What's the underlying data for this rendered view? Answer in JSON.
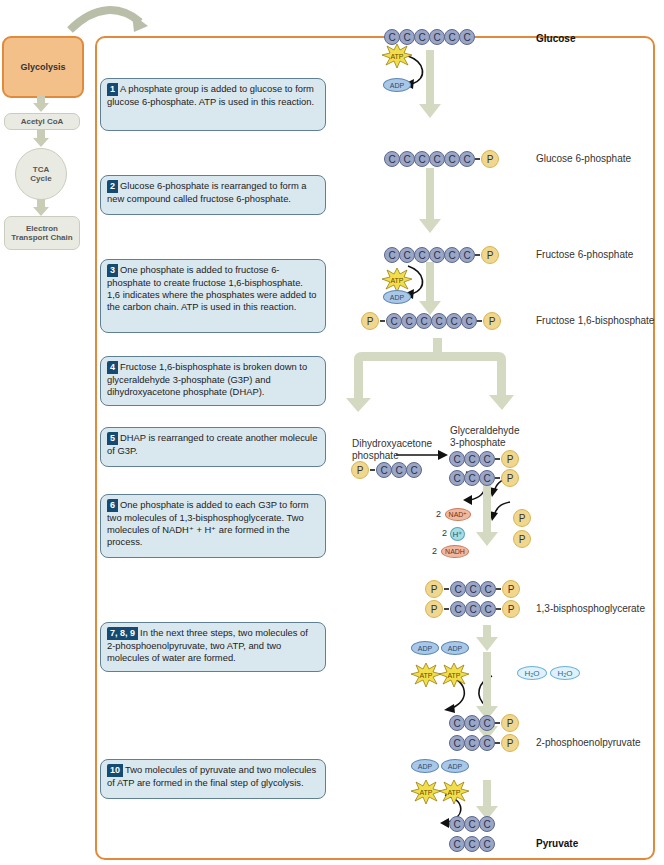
{
  "sidebar": {
    "items": [
      {
        "label": "Glycolysis",
        "active": true
      },
      {
        "label": "Acetyl CoA"
      },
      {
        "label": "TCA Cycle"
      },
      {
        "label": "Electron Transport Chain"
      }
    ]
  },
  "steps": [
    {
      "num": "1",
      "text": "A phosphate group is added to glucose to form glucose 6-phosphate. ATP is used in this reaction."
    },
    {
      "num": "2",
      "text": "Glucose 6-phosphate is rearranged to form a new compound called fructose 6-phosphate."
    },
    {
      "num": "3",
      "text": "One phosphate is added to fructose 6-phosphate to create fructose 1,6-bisphosphate. 1,6 indicates where the phosphates were added to the carbon chain. ATP is used in this reaction."
    },
    {
      "num": "4",
      "text": "Fructose 1,6-bisphosphate is broken down to glyceraldehyde 3-phosphate (G3P) and dihydroxyacetone phosphate (DHAP)."
    },
    {
      "num": "5",
      "text": "DHAP is rearranged to create another molecule of G3P."
    },
    {
      "num": "6",
      "text": "One phosphate is added to each G3P to form two molecules of 1,3-bisphosphoglycerate. Two molecules of NADH⁺ + H⁺ are formed in the process."
    },
    {
      "num": "7, 8, 9",
      "text": "In the next three steps, two molecules of 2-phosphoenolpyruvate, two ATP, and two molecules of water are formed."
    },
    {
      "num": "10",
      "text": "Two molecules of pyruvate and two molecules of ATP are formed in the final step of glycolysis."
    }
  ],
  "molecules": {
    "glucose": "Glucose",
    "g6p": "Glucose 6-phosphate",
    "f6p": "Fructose 6-phosphate",
    "f16bp": "Fructose 1,6-bisphosphate",
    "dhap": "Dihydroxyacetone phosphate",
    "g3p": "Glyceraldehyde 3-phosphate",
    "bpg": "1,3-bisphosphoglycerate",
    "pep": "2-phosphoenolpyruvate",
    "pyruvate": "Pyruvate"
  },
  "symbols": {
    "carbon": "C",
    "phosphate": "P",
    "atp": "ATP",
    "adp": "ADP",
    "nad": "NAD⁺",
    "nadh": "NADH",
    "h": "H⁺",
    "h2o": "H₂O",
    "coef2": "2"
  },
  "colors": {
    "frame": "#e08a3c",
    "step_box": "#d9e7ef",
    "step_num": "#154b73",
    "carbon": "#9aa6c4",
    "phosphate": "#f1d68e",
    "arrow": "#d4d9c1"
  }
}
